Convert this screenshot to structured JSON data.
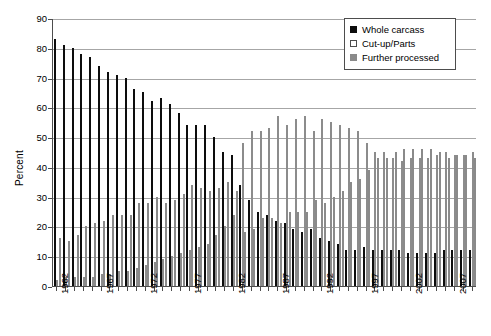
{
  "chart_data": {
    "type": "bar",
    "title": "",
    "xlabel": "",
    "ylabel": "Percent",
    "ylim": [
      0,
      90
    ],
    "ytick_step": 10,
    "yticks": [
      0,
      10,
      20,
      30,
      40,
      50,
      60,
      70,
      80,
      90
    ],
    "grid": true,
    "legend_position": "top-right",
    "x_tick_labels": [
      "1962",
      "1967",
      "1972",
      "1977",
      "1982",
      "1987",
      "1992",
      "1997",
      "2002",
      "2007"
    ],
    "x_tick_label_interval": 5,
    "categories": [
      "1962",
      "1963",
      "1964",
      "1965",
      "1966",
      "1967",
      "1968",
      "1969",
      "1970",
      "1971",
      "1972",
      "1973",
      "1974",
      "1975",
      "1976",
      "1977",
      "1978",
      "1979",
      "1980",
      "1981",
      "1982",
      "1983",
      "1984",
      "1985",
      "1986",
      "1987",
      "1988",
      "1989",
      "1990",
      "1991",
      "1992",
      "1993",
      "1994",
      "1995",
      "1996",
      "1997",
      "1998",
      "1999",
      "2000",
      "2001",
      "2002",
      "2003",
      "2004",
      "2005",
      "2006",
      "2007",
      "2008",
      "2009"
    ],
    "series": [
      {
        "name": "Whole carcass",
        "color": "#0d0d0d",
        "values": [
          83,
          81,
          80,
          78,
          77,
          74,
          72,
          71,
          70,
          66,
          65,
          62,
          63,
          61,
          58,
          54,
          54,
          54,
          50,
          45,
          44,
          34,
          29,
          25,
          24,
          22,
          21,
          19,
          18,
          19,
          16,
          15,
          14,
          12,
          12,
          13,
          12,
          12,
          12,
          12,
          11,
          11,
          11,
          11,
          12,
          12,
          12,
          12
        ]
      },
      {
        "name": "Cut-up/Parts",
        "color": "#ffffff",
        "values": [
          2,
          3,
          3,
          3,
          3,
          4,
          4,
          5,
          5,
          6,
          7,
          8,
          9,
          10,
          11,
          12,
          13,
          14,
          17,
          20,
          24,
          48,
          52,
          52,
          53,
          57,
          54,
          56,
          57,
          52,
          56,
          55,
          54,
          53,
          52,
          48,
          45,
          45,
          43,
          42,
          43,
          43,
          43,
          44,
          45,
          44,
          44,
          45
        ]
      },
      {
        "name": "Further processed",
        "color": "#8a8a8a",
        "values": [
          16,
          15,
          17,
          20,
          21,
          22,
          24,
          24,
          24,
          28,
          28,
          30,
          28,
          29,
          31,
          34,
          33,
          32,
          33,
          35,
          32,
          18,
          19,
          23,
          23,
          21,
          25,
          25,
          25,
          29,
          28,
          30,
          32,
          35,
          36,
          39,
          43,
          43,
          45,
          46,
          46,
          46,
          46,
          45,
          43,
          44,
          44,
          43
        ]
      }
    ]
  },
  "legend": {
    "items": [
      {
        "label": "Whole carcass",
        "swatch": "whole"
      },
      {
        "label": "Cut-up/Parts",
        "swatch": "cutup"
      },
      {
        "label": "Further processed",
        "swatch": "further"
      }
    ]
  },
  "axis": {
    "y_title": "Percent"
  }
}
